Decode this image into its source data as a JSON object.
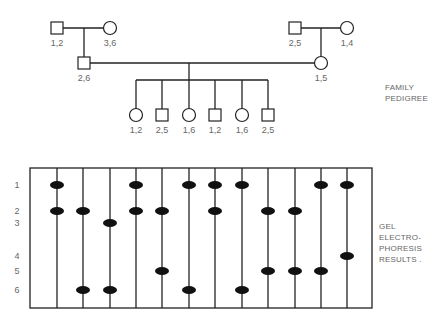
{
  "pedigree": {
    "title_lines": [
      "FAMILY",
      "PEDIGREE"
    ],
    "individuals": [
      {
        "id": "paternal-grandfather",
        "sex": "male",
        "generation": 1,
        "genotype": "1,2",
        "x": 57,
        "y": 28
      },
      {
        "id": "paternal-grandmother",
        "sex": "female",
        "generation": 1,
        "genotype": "3,6",
        "x": 110,
        "y": 28
      },
      {
        "id": "maternal-grandfather",
        "sex": "male",
        "generation": 1,
        "genotype": "2,5",
        "x": 295,
        "y": 28
      },
      {
        "id": "maternal-grandmother",
        "sex": "female",
        "generation": 1,
        "genotype": "1,4",
        "x": 347,
        "y": 28
      },
      {
        "id": "father",
        "sex": "male",
        "generation": 2,
        "genotype": "2,6",
        "x": 84,
        "y": 63
      },
      {
        "id": "mother",
        "sex": "female",
        "generation": 2,
        "genotype": "1,5",
        "x": 321,
        "y": 63
      },
      {
        "id": "child-1",
        "sex": "female",
        "generation": 3,
        "genotype": "1,2",
        "x": 136,
        "y": 115
      },
      {
        "id": "child-2",
        "sex": "male",
        "generation": 3,
        "genotype": "2,5",
        "x": 162,
        "y": 115
      },
      {
        "id": "child-3",
        "sex": "female",
        "generation": 3,
        "genotype": "1,6",
        "x": 189,
        "y": 115
      },
      {
        "id": "child-4",
        "sex": "male",
        "generation": 3,
        "genotype": "1,2",
        "x": 215,
        "y": 115
      },
      {
        "id": "child-5",
        "sex": "female",
        "generation": 3,
        "genotype": "1,6",
        "x": 242,
        "y": 115
      },
      {
        "id": "child-6",
        "sex": "male",
        "generation": 3,
        "genotype": "2,5",
        "x": 268,
        "y": 115
      }
    ]
  },
  "gel": {
    "title_lines": [
      "GEL",
      "ELECTRO-",
      "PHORESIS",
      "RESULTS ."
    ],
    "row_labels": [
      "1",
      "2",
      "3",
      "4",
      "5",
      "6"
    ],
    "row_y": [
      185,
      211,
      223,
      256,
      271,
      290
    ],
    "lane_x": [
      57,
      83,
      110,
      136,
      162,
      189,
      215,
      242,
      268,
      295,
      321,
      347
    ],
    "lanes": [
      {
        "lane": 1,
        "bands": [
          1,
          2
        ]
      },
      {
        "lane": 2,
        "bands": [
          2,
          6
        ]
      },
      {
        "lane": 3,
        "bands": [
          3,
          6
        ]
      },
      {
        "lane": 4,
        "bands": [
          1,
          2
        ]
      },
      {
        "lane": 5,
        "bands": [
          2,
          5
        ]
      },
      {
        "lane": 6,
        "bands": [
          1,
          6
        ]
      },
      {
        "lane": 7,
        "bands": [
          1,
          2
        ]
      },
      {
        "lane": 8,
        "bands": [
          1,
          6
        ]
      },
      {
        "lane": 9,
        "bands": [
          2,
          5
        ]
      },
      {
        "lane": 10,
        "bands": [
          2,
          5
        ]
      },
      {
        "lane": 11,
        "bands": [
          1,
          5
        ]
      },
      {
        "lane": 12,
        "bands": [
          1,
          4
        ]
      }
    ]
  }
}
